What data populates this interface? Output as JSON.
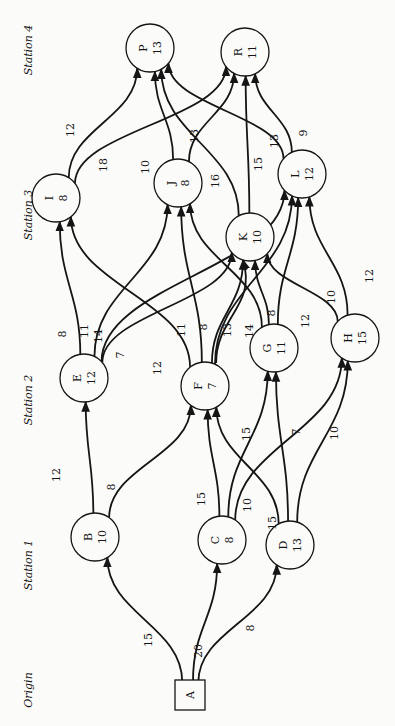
{
  "stations": [
    {
      "label": "Origin",
      "x": 28,
      "y": 690
    },
    {
      "label": "Station 1",
      "x": 28,
      "y": 565
    },
    {
      "label": "Station 2",
      "x": 28,
      "y": 400
    },
    {
      "label": "Station 3",
      "x": 28,
      "y": 215
    },
    {
      "label": "Station 4",
      "x": 28,
      "y": 50
    }
  ],
  "nodes": [
    {
      "id": "A",
      "value": "",
      "shape": "square",
      "x": 190,
      "y": 695
    },
    {
      "id": "B",
      "value": "10",
      "x": 95,
      "y": 537
    },
    {
      "id": "C",
      "value": "8",
      "x": 222,
      "y": 540
    },
    {
      "id": "D",
      "value": "13",
      "x": 290,
      "y": 545
    },
    {
      "id": "E",
      "value": "12",
      "x": 84,
      "y": 378
    },
    {
      "id": "F",
      "value": "7",
      "x": 205,
      "y": 386
    },
    {
      "id": "G",
      "value": "11",
      "x": 274,
      "y": 348
    },
    {
      "id": "H",
      "value": "15",
      "x": 355,
      "y": 338
    },
    {
      "id": "I",
      "value": "8",
      "x": 56,
      "y": 198
    },
    {
      "id": "J",
      "value": "8",
      "x": 178,
      "y": 183
    },
    {
      "id": "K",
      "value": "10",
      "x": 250,
      "y": 237
    },
    {
      "id": "L",
      "value": "12",
      "x": 302,
      "y": 174
    },
    {
      "id": "P",
      "value": "13",
      "x": 150,
      "y": 48
    },
    {
      "id": "R",
      "value": "11",
      "x": 245,
      "y": 52
    }
  ],
  "edges": [
    {
      "from": "A",
      "to": "B",
      "weight": "15"
    },
    {
      "from": "A",
      "to": "C",
      "weight": "20"
    },
    {
      "from": "A",
      "to": "D",
      "weight": "8"
    },
    {
      "from": "B",
      "to": "E",
      "weight": "12"
    },
    {
      "from": "B",
      "to": "F",
      "weight": "8"
    },
    {
      "from": "C",
      "to": "F",
      "weight": "15"
    },
    {
      "from": "C",
      "to": "G",
      "weight": "10"
    },
    {
      "from": "C",
      "to": "H",
      "weight": "15"
    },
    {
      "from": "D",
      "to": "F",
      "weight": "15"
    },
    {
      "from": "D",
      "to": "G",
      "weight": "7"
    },
    {
      "from": "D",
      "to": "H",
      "weight": "10"
    },
    {
      "from": "E",
      "to": "I",
      "weight": "8"
    },
    {
      "from": "E",
      "to": "J",
      "weight": "11"
    },
    {
      "from": "E",
      "to": "L",
      "weight": "14"
    },
    {
      "from": "E",
      "to": "K",
      "weight": "7"
    },
    {
      "from": "F",
      "to": "I",
      "weight": "12"
    },
    {
      "from": "F",
      "to": "J",
      "weight": "11"
    },
    {
      "from": "F",
      "to": "K",
      "weight": "8"
    },
    {
      "from": "F",
      "to": "K",
      "weight": "13"
    },
    {
      "from": "F",
      "to": "L",
      "weight": "14"
    },
    {
      "from": "G",
      "to": "J",
      "weight": "8"
    },
    {
      "from": "G",
      "to": "K",
      "weight": "8"
    },
    {
      "from": "G",
      "to": "L",
      "weight": "12"
    },
    {
      "from": "H",
      "to": "K",
      "weight": "10"
    },
    {
      "from": "H",
      "to": "L",
      "weight": "12"
    },
    {
      "from": "I",
      "to": "P",
      "weight": "12"
    },
    {
      "from": "I",
      "to": "R",
      "weight": "18"
    },
    {
      "from": "J",
      "to": "P",
      "weight": "10"
    },
    {
      "from": "J",
      "to": "R",
      "weight": "13"
    },
    {
      "from": "K",
      "to": "P",
      "weight": "16"
    },
    {
      "from": "K",
      "to": "R",
      "weight": "15"
    },
    {
      "from": "L",
      "to": "P",
      "weight": "13"
    },
    {
      "from": "L",
      "to": "R",
      "weight": "9"
    }
  ],
  "weight_labels": [
    {
      "text": "15",
      "x": 148,
      "y": 640
    },
    {
      "text": "20",
      "x": 198,
      "y": 651
    },
    {
      "text": "8",
      "x": 250,
      "y": 628
    },
    {
      "text": "12",
      "x": 56,
      "y": 475
    },
    {
      "text": "8",
      "x": 111,
      "y": 487
    },
    {
      "text": "15",
      "x": 201,
      "y": 499
    },
    {
      "text": "10",
      "x": 247,
      "y": 505
    },
    {
      "text": "15",
      "x": 272,
      "y": 523
    },
    {
      "text": "15",
      "x": 246,
      "y": 434
    },
    {
      "text": "7",
      "x": 296,
      "y": 432
    },
    {
      "text": "10",
      "x": 334,
      "y": 433
    },
    {
      "text": "8",
      "x": 62,
      "y": 334
    },
    {
      "text": "11",
      "x": 84,
      "y": 331
    },
    {
      "text": "14",
      "x": 98,
      "y": 336
    },
    {
      "text": "7",
      "x": 120,
      "y": 355
    },
    {
      "text": "12",
      "x": 157,
      "y": 368
    },
    {
      "text": "11",
      "x": 181,
      "y": 330
    },
    {
      "text": "8",
      "x": 203,
      "y": 327
    },
    {
      "text": "13",
      "x": 227,
      "y": 330
    },
    {
      "text": "14",
      "x": 249,
      "y": 331
    },
    {
      "text": "8",
      "x": 271,
      "y": 313
    },
    {
      "text": "12",
      "x": 305,
      "y": 321
    },
    {
      "text": "10",
      "x": 331,
      "y": 297
    },
    {
      "text": "12",
      "x": 369,
      "y": 276
    },
    {
      "text": "12",
      "x": 70,
      "y": 130
    },
    {
      "text": "18",
      "x": 103,
      "y": 165
    },
    {
      "text": "10",
      "x": 145,
      "y": 167
    },
    {
      "text": "13",
      "x": 194,
      "y": 136
    },
    {
      "text": "16",
      "x": 215,
      "y": 181
    },
    {
      "text": "15",
      "x": 258,
      "y": 164
    },
    {
      "text": "13",
      "x": 274,
      "y": 141
    },
    {
      "text": "9",
      "x": 303,
      "y": 133
    }
  ]
}
